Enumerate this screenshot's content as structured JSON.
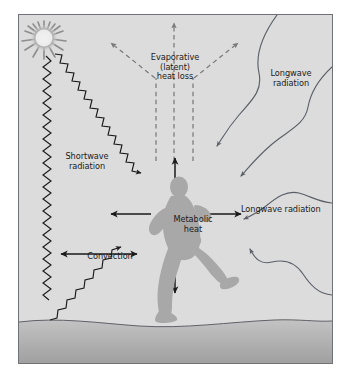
{
  "figure": {
    "panel": {
      "background_color": "#dcdcdc",
      "border_color": "#6f7276",
      "ground_color": "#b3b3b3"
    },
    "labels": {
      "evaporative": {
        "line1": "Evaporative",
        "line2": "(latent)",
        "line3": "heat loss"
      },
      "longwave_upper": {
        "line1": "Longwave",
        "line2": "radiation"
      },
      "longwave_lower": {
        "line1": "Longwave radiation"
      },
      "shortwave": {
        "line1": "Shortwave",
        "line2": "radiation"
      },
      "convection": {
        "line1": "Convection"
      },
      "metabolic": {
        "line1": "Metabolic",
        "line2": "heat"
      }
    },
    "icons": {
      "sun": "sun-icon",
      "runner": "running-person-icon"
    },
    "colors": {
      "arrow_solid": "#1a1a1a",
      "arrow_dashed": "#767676",
      "wave_line": "#5b6068",
      "zigzag": "#1a1a1a",
      "figure_fill": "#a8a8a8",
      "sun_core": "#f2f2f2",
      "sun_glow": "#9a9a9a",
      "text": "#1a1a1a"
    },
    "flows": [
      {
        "name": "shortwave-radiation",
        "style": "zigzag",
        "count": 3,
        "direction": "incoming-and-reflected"
      },
      {
        "name": "longwave-radiation",
        "style": "wavy-curve",
        "count": 4,
        "direction": "incoming-and-outgoing"
      },
      {
        "name": "evaporative-latent-heat-loss",
        "style": "dashed-arrow",
        "count": 5,
        "direction": "upward-outward"
      },
      {
        "name": "metabolic-heat",
        "style": "solid-arrow",
        "count": 4,
        "direction": "radiating-from-body"
      },
      {
        "name": "convection",
        "style": "double-headed-arrow",
        "count": 1,
        "direction": "horizontal"
      }
    ]
  }
}
